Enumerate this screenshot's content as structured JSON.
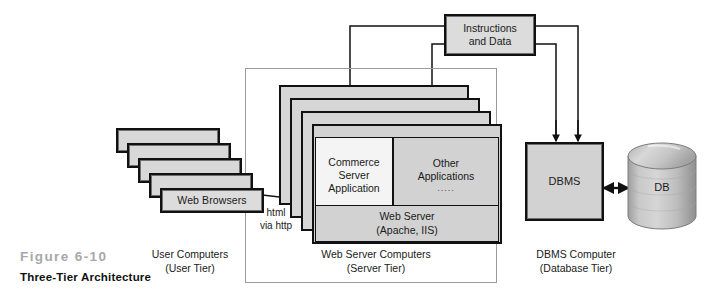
{
  "figure": {
    "number": "Figure 6-10",
    "title": "Three-Tier Architecture"
  },
  "tiers": [
    {
      "id": "user",
      "name": "User Computers",
      "sub": "(User Tier)"
    },
    {
      "id": "server",
      "name": "Web Server Computers",
      "sub": "(Server Tier)"
    },
    {
      "id": "database",
      "name": "DBMS Computer",
      "sub": "(Database Tier)"
    }
  ],
  "user_tier": {
    "browser_label": "Web Browsers",
    "stack_count": 5
  },
  "server_tier": {
    "stack_count": 4,
    "commerce": "Commerce\nServer\nApplication",
    "commerce_lines": [
      "Commerce",
      "Server",
      "Application"
    ],
    "other": "Other\nApplications",
    "other_lines": [
      "Other",
      "Applications"
    ],
    "other_dots": ".....",
    "web_server_lines": [
      "Web Server",
      "(Apache, IIS)"
    ]
  },
  "database_tier": {
    "dbms": "DBMS",
    "db": "DB"
  },
  "connectors": {
    "instructions_lines": [
      "Instructions",
      "and Data"
    ],
    "html_label_lines": [
      "html",
      "via http"
    ]
  },
  "colors": {
    "box_fill": "#d8d8d8",
    "panel_light": "#f4f4f4",
    "panel_gray": "#d2d2d2",
    "outline": "#111111",
    "frame": "#9a9a9a",
    "fig_number": "#a8a8a8",
    "cylinder": "#b9b9b9"
  }
}
